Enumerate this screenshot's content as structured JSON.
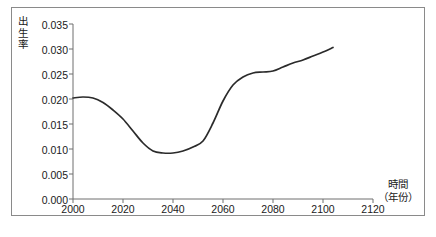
{
  "chart_data": {
    "type": "line",
    "title": "",
    "xlabel": "時間（年份）",
    "xlabel_main": "時間",
    "xlabel_unit": "（年份）",
    "ylabel": "出生率",
    "ylabel_chars": [
      "出",
      "生",
      "率"
    ],
    "xlim": [
      2000,
      2120
    ],
    "ylim": [
      0.0,
      0.035
    ],
    "xticks": [
      2000,
      2020,
      2040,
      2060,
      2080,
      2100,
      2120
    ],
    "xtick_labels": [
      "2000",
      "2020",
      "2040",
      "2060",
      "2080",
      "2100",
      "2120"
    ],
    "yticks": [
      0.0,
      0.005,
      0.01,
      0.015,
      0.02,
      0.025,
      0.03,
      0.035
    ],
    "ytick_labels": [
      "0.000",
      "0.005",
      "0.010",
      "0.015",
      "0.020",
      "0.025",
      "0.030",
      "0.035"
    ],
    "grid": false,
    "legend": false,
    "line_color": "#2b2b2b",
    "axis_color": "#6f6f6f",
    "border_color": "#8a8a8a",
    "series": [
      {
        "name": "出生率",
        "x": [
          2000,
          2004,
          2008,
          2012,
          2016,
          2020,
          2024,
          2028,
          2032,
          2036,
          2040,
          2044,
          2048,
          2052,
          2056,
          2060,
          2064,
          2068,
          2072,
          2076,
          2080,
          2084,
          2088,
          2092,
          2096,
          2100,
          2104
        ],
        "values": [
          0.0202,
          0.0204,
          0.0202,
          0.0193,
          0.0178,
          0.016,
          0.0136,
          0.0112,
          0.0096,
          0.0092,
          0.0092,
          0.0096,
          0.0104,
          0.0116,
          0.0152,
          0.0196,
          0.0228,
          0.0244,
          0.0252,
          0.0254,
          0.0256,
          0.0264,
          0.0272,
          0.0278,
          0.0286,
          0.0294,
          0.0303
        ]
      }
    ]
  }
}
